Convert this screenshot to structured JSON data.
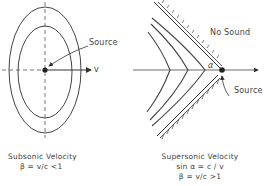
{
  "subsonic": {
    "source_label": "Source",
    "velocity_label": "v",
    "caption_title": "Subsonic Velocity",
    "caption_formula": "β = v/c <1"
  },
  "supersonic": {
    "no_sound_label": "No Sound",
    "source_label": "Source",
    "angle_label": "α",
    "caption_title": "Supersonic Velocity",
    "caption_formula_1": "sin α = c / v",
    "caption_formula_2": "β = v/c >1"
  },
  "colors": {
    "line": "#444444",
    "background": "#ffffff"
  }
}
